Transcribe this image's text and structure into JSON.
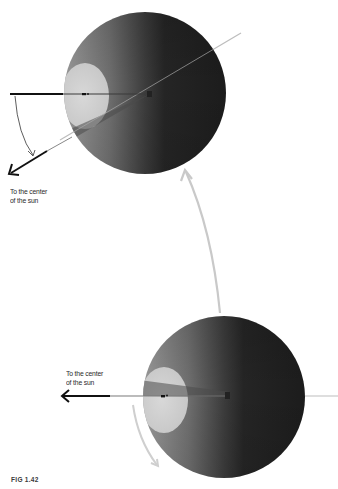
{
  "figure": {
    "caption": "FIG 1.42",
    "colors": {
      "sphere_light": "#8e8e8e",
      "sphere_dark": "#1e1e1e",
      "lit_disc": "#d3d3d3",
      "axis_line": "#c0c0c0",
      "orbit_arrow": "#c8c8c8",
      "sun_arrow": "#111111"
    },
    "top_sphere": {
      "sun_label_line1": "To the center",
      "sun_label_line2": "of the sun"
    },
    "bottom_sphere": {
      "sun_label_line1": "To the center",
      "sun_label_line2": "of the sun"
    }
  }
}
